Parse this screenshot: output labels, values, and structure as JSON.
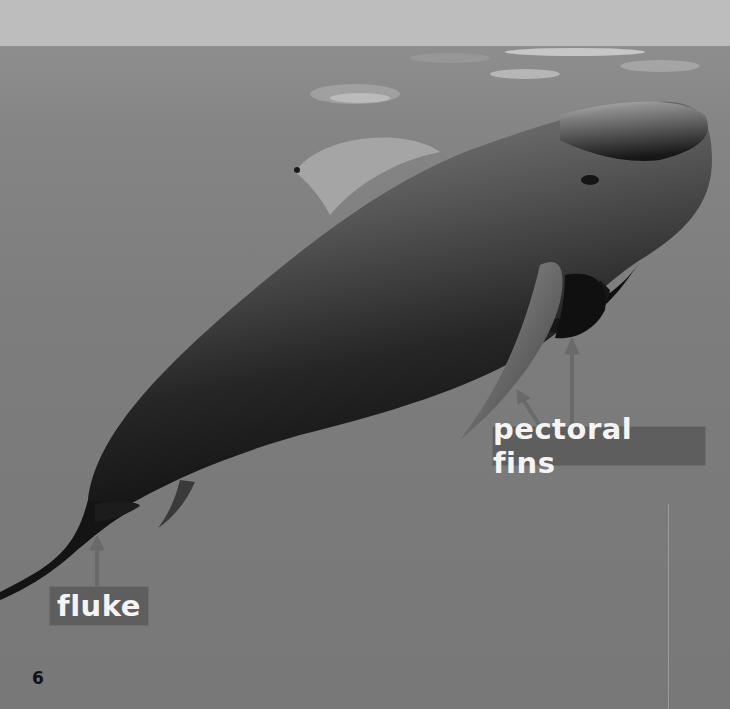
{
  "page": {
    "type": "book-page-photo",
    "page_number": "6"
  },
  "labels": {
    "pectoral_fins": "pectoral fins",
    "fluke": "fluke"
  },
  "colors": {
    "label_background": "#5e5e5e",
    "label_text": "#f4f4f4",
    "arrow": "#6a6a6a",
    "sky": "#bdbdbd",
    "water": "#7c7c7c",
    "whale_dark": "#1a1a1a",
    "page_number": "#111111"
  },
  "icons": {
    "arrow_pectoral_left": "arrow-up-left-icon",
    "arrow_pectoral_right": "arrow-up-icon",
    "arrow_fluke": "arrow-up-icon"
  }
}
